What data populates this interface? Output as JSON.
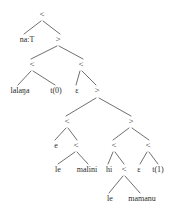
{
  "figure": {
    "type": "syntax-derivation-tree",
    "ink_color": "#2b2b2b",
    "line_color": "#4a4a48",
    "background": "#ffffff",
    "width": 171,
    "height": 217
  },
  "nodes": [
    {
      "id": "n0",
      "label": "<",
      "x": 42,
      "y": 17,
      "size": 9,
      "role": "root-combinator"
    },
    {
      "id": "n1",
      "label": "na:T",
      "x": 27,
      "y": 42,
      "size": 8,
      "role": "leaf-word"
    },
    {
      "id": "n2",
      "label": ">",
      "x": 58,
      "y": 42,
      "size": 9,
      "role": "combinator"
    },
    {
      "id": "n3",
      "label": "<",
      "x": 32,
      "y": 67,
      "size": 9,
      "role": "combinator"
    },
    {
      "id": "n4",
      "label": "<",
      "x": 81,
      "y": 67,
      "size": 9,
      "role": "combinator"
    },
    {
      "id": "n5",
      "label": "lalaŋa",
      "x": 20,
      "y": 93,
      "size": 8,
      "role": "leaf-word"
    },
    {
      "id": "n6",
      "label": "t(0)",
      "x": 56,
      "y": 93,
      "size": 8,
      "role": "leaf-trace"
    },
    {
      "id": "n7",
      "label": "ε",
      "x": 77,
      "y": 93,
      "size": 8,
      "role": "leaf-empty"
    },
    {
      "id": "n8",
      "label": ">",
      "x": 97,
      "y": 93,
      "size": 9,
      "role": "combinator"
    },
    {
      "id": "n9",
      "label": "<",
      "x": 67,
      "y": 124,
      "size": 9,
      "role": "combinator"
    },
    {
      "id": "n10",
      "label": ">",
      "x": 131,
      "y": 124,
      "size": 9,
      "role": "combinator"
    },
    {
      "id": "n11",
      "label": "e",
      "x": 56,
      "y": 148,
      "size": 8,
      "role": "leaf-word"
    },
    {
      "id": "n12",
      "label": "<",
      "x": 76,
      "y": 148,
      "size": 9,
      "role": "combinator"
    },
    {
      "id": "n13",
      "label": "<",
      "x": 114,
      "y": 148,
      "size": 9,
      "role": "combinator"
    },
    {
      "id": "n14",
      "label": "<",
      "x": 148,
      "y": 148,
      "size": 9,
      "role": "combinator"
    },
    {
      "id": "n15",
      "label": "le",
      "x": 58,
      "y": 172,
      "size": 8,
      "role": "leaf-word"
    },
    {
      "id": "n16",
      "label": "malini",
      "x": 87,
      "y": 172,
      "size": 8,
      "role": "leaf-word"
    },
    {
      "id": "n17",
      "label": "hi",
      "x": 109,
      "y": 172,
      "size": 8,
      "role": "leaf-word"
    },
    {
      "id": "n18",
      "label": "<",
      "x": 124,
      "y": 172,
      "size": 9,
      "role": "combinator"
    },
    {
      "id": "n19",
      "label": "ε",
      "x": 139,
      "y": 172,
      "size": 8,
      "role": "leaf-empty"
    },
    {
      "id": "n20",
      "label": "t(1)",
      "x": 158,
      "y": 172,
      "size": 8,
      "role": "leaf-trace"
    },
    {
      "id": "n21",
      "label": "le",
      "x": 110,
      "y": 201,
      "size": 8,
      "role": "leaf-word"
    },
    {
      "id": "n22",
      "label": "mamanu",
      "x": 142,
      "y": 201,
      "size": 8,
      "role": "leaf-word"
    }
  ],
  "edges": [
    {
      "from": "n0",
      "to": "n1",
      "x1": 41,
      "y1": 21,
      "x2": 24,
      "y2": 34
    },
    {
      "from": "n0",
      "to": "n2",
      "x1": 43,
      "y1": 21,
      "x2": 60,
      "y2": 34
    },
    {
      "from": "n2",
      "to": "n3",
      "x1": 57,
      "y1": 46,
      "x2": 31,
      "y2": 59
    },
    {
      "from": "n2",
      "to": "n4",
      "x1": 59,
      "y1": 46,
      "x2": 83,
      "y2": 59
    },
    {
      "from": "n3",
      "to": "n5",
      "x1": 31,
      "y1": 71,
      "x2": 18,
      "y2": 85
    },
    {
      "from": "n3",
      "to": "n6",
      "x1": 33,
      "y1": 71,
      "x2": 55,
      "y2": 85
    },
    {
      "from": "n4",
      "to": "n7",
      "x1": 80,
      "y1": 71,
      "x2": 76,
      "y2": 85
    },
    {
      "from": "n4",
      "to": "n8",
      "x1": 82,
      "y1": 71,
      "x2": 96,
      "y2": 85
    },
    {
      "from": "n8",
      "to": "n9",
      "x1": 96,
      "y1": 98,
      "x2": 66,
      "y2": 116
    },
    {
      "from": "n8",
      "to": "n10",
      "x1": 99,
      "y1": 98,
      "x2": 131,
      "y2": 116
    },
    {
      "from": "n9",
      "to": "n11",
      "x1": 66,
      "y1": 128,
      "x2": 55,
      "y2": 140
    },
    {
      "from": "n9",
      "to": "n12",
      "x1": 68,
      "y1": 128,
      "x2": 77,
      "y2": 140
    },
    {
      "from": "n10",
      "to": "n13",
      "x1": 129,
      "y1": 128,
      "x2": 113,
      "y2": 140
    },
    {
      "from": "n10",
      "to": "n14",
      "x1": 132,
      "y1": 128,
      "x2": 149,
      "y2": 140
    },
    {
      "from": "n12",
      "to": "n15",
      "x1": 75,
      "y1": 152,
      "x2": 58,
      "y2": 164
    },
    {
      "from": "n12",
      "to": "n16",
      "x1": 77,
      "y1": 152,
      "x2": 88,
      "y2": 164
    },
    {
      "from": "n13",
      "to": "n17",
      "x1": 113,
      "y1": 152,
      "x2": 108,
      "y2": 164
    },
    {
      "from": "n13",
      "to": "n18",
      "x1": 115,
      "y1": 152,
      "x2": 124,
      "y2": 164
    },
    {
      "from": "n14",
      "to": "n19",
      "x1": 147,
      "y1": 152,
      "x2": 140,
      "y2": 164
    },
    {
      "from": "n14",
      "to": "n20",
      "x1": 149,
      "y1": 152,
      "x2": 158,
      "y2": 164
    },
    {
      "from": "n18",
      "to": "n21",
      "x1": 123,
      "y1": 176,
      "x2": 109,
      "y2": 193
    },
    {
      "from": "n18",
      "to": "n22",
      "x1": 125,
      "y1": 176,
      "x2": 140,
      "y2": 193
    }
  ]
}
